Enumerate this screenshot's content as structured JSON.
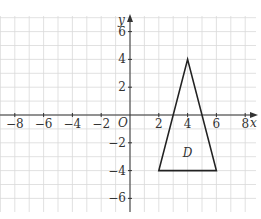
{
  "diagram": {
    "type": "coordinate-grid",
    "axes": {
      "x_label": "x",
      "y_label": "y",
      "origin_label": "O",
      "x_range": [
        -9,
        9
      ],
      "y_range": [
        -7,
        7
      ],
      "x_ticks": [
        {
          "value": -8,
          "label": "−8"
        },
        {
          "value": -6,
          "label": "−6"
        },
        {
          "value": -4,
          "label": "−4"
        },
        {
          "value": -2,
          "label": "−2"
        },
        {
          "value": 2,
          "label": "2"
        },
        {
          "value": 4,
          "label": "4"
        },
        {
          "value": 6,
          "label": "6"
        },
        {
          "value": 8,
          "label": "8"
        }
      ],
      "y_ticks": [
        {
          "value": 6,
          "label": "6"
        },
        {
          "value": 4,
          "label": "4"
        },
        {
          "value": 2,
          "label": "2"
        },
        {
          "value": -2,
          "label": "−2"
        },
        {
          "value": -4,
          "label": "−4"
        },
        {
          "value": -6,
          "label": "−6"
        }
      ]
    },
    "shapes": [
      {
        "name": "D",
        "kind": "triangle",
        "label": "D",
        "label_position": [
          4,
          -2.7
        ],
        "vertices": [
          [
            4,
            4
          ],
          [
            2,
            -4
          ],
          [
            6,
            -4
          ]
        ]
      }
    ],
    "colors": {
      "grid": "#d9d9d9",
      "axis": "#333333",
      "shape": "#222222"
    }
  }
}
